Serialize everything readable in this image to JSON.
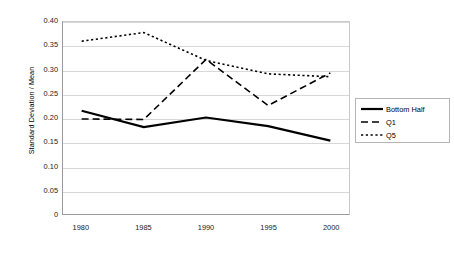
{
  "chart_data": {
    "type": "line",
    "title": "",
    "xlabel": "",
    "ylabel": "Standard Deviation / Mean",
    "x": [
      1980,
      1985,
      1990,
      1995,
      2000
    ],
    "xtick_labels": [
      "1980",
      "1985",
      "1990",
      "1995",
      "2000"
    ],
    "ytick_labels": [
      "0.40",
      "0.35",
      "0.30",
      "0.25",
      "0.20",
      "0.15",
      "0.10",
      "0.05",
      "0"
    ],
    "ytick_values": [
      0.4,
      0.35,
      0.3,
      0.25,
      0.2,
      0.15,
      0.1,
      0.05,
      0.0
    ],
    "ylim": [
      0.0,
      0.4
    ],
    "xlim": [
      1978.5,
      2001.5
    ],
    "grid": "horizontal",
    "legend_position": "right",
    "series": [
      {
        "name": "Bottom Half",
        "style": "solid",
        "color": "#000000",
        "width": 2.2,
        "values": [
          0.215,
          0.181,
          0.201,
          0.183,
          0.153
        ]
      },
      {
        "name": "Q1",
        "style": "dashed",
        "color": "#000000",
        "width": 1.6,
        "values": [
          0.198,
          0.197,
          0.322,
          0.226,
          0.294
        ]
      },
      {
        "name": "Q5",
        "style": "dotted",
        "color": "#000000",
        "width": 1.6,
        "values": [
          0.36,
          0.378,
          0.32,
          0.292,
          0.286
        ]
      }
    ]
  },
  "legend": {
    "entries": [
      {
        "label": "Bottom Half"
      },
      {
        "label": "Q1"
      },
      {
        "label": "Q5"
      }
    ]
  }
}
